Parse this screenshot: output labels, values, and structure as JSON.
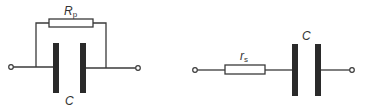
{
  "diagram": {
    "type": "circuit-schematic",
    "circuits": [
      {
        "id": "parallel-model",
        "description": "Capacitor C with parallel resistance Rp",
        "components": [
          {
            "kind": "resistor",
            "label_main": "R",
            "label_sub": "p",
            "connection": "parallel"
          },
          {
            "kind": "capacitor",
            "label_main": "C",
            "label_sub": ""
          }
        ],
        "terminals": 2
      },
      {
        "id": "series-model",
        "description": "Capacitor C with series resistance rs",
        "components": [
          {
            "kind": "resistor",
            "label_main": "r",
            "label_sub": "s",
            "connection": "series"
          },
          {
            "kind": "capacitor",
            "label_main": "C",
            "label_sub": ""
          }
        ],
        "terminals": 2
      }
    ]
  }
}
